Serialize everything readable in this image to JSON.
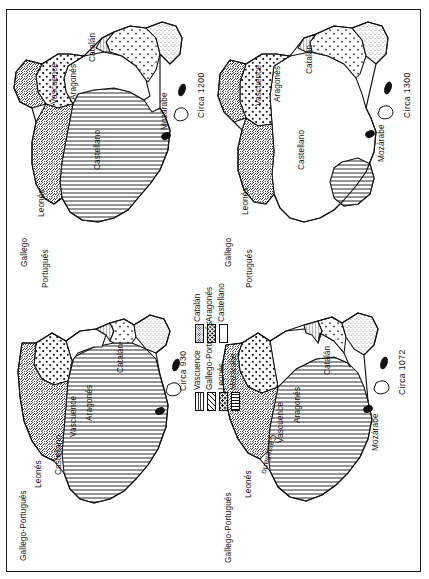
{
  "figure": {
    "orientation": "page rotated 90 degrees (landscape figure on portrait page)",
    "panel_count": 4
  },
  "patterns": {
    "vascuence": {
      "name": "Vascuence",
      "fill": "fine-vertical-hatch"
    },
    "gallego_portugues": {
      "name": "Gallego-Portugués",
      "fill": "diagonal-hatch"
    },
    "leones": {
      "name": "Leonés",
      "fill": "coarse-dots"
    },
    "mozarabe": {
      "name": "Mozárabe",
      "fill": "horizontal-lines"
    },
    "catalan": {
      "name": "Catalán",
      "fill": "stipple-fine-dots"
    },
    "aragones": {
      "name": "Aragonés",
      "fill": "medium-dots"
    },
    "castellano": {
      "name": "Castellano",
      "fill": "blank-white"
    }
  },
  "legend": {
    "name": "map-legend",
    "column_left": [
      {
        "label": "Vascuence",
        "pattern": "fine-vertical-hatch"
      },
      {
        "label": "Gallego-Portugués",
        "pattern": "diagonal-hatch"
      },
      {
        "label": "Leonés",
        "pattern": "coarse-dots"
      },
      {
        "label": "Mozárabe",
        "pattern": "horizontal-lines"
      }
    ],
    "column_right": [
      {
        "label": "Catalán",
        "pattern": "stipple-fine-dots"
      },
      {
        "label": "Aragonés",
        "pattern": "medium-dots"
      },
      {
        "label": "Castellano",
        "pattern": "blank-white"
      }
    ]
  },
  "maps": [
    {
      "id": "map-circa-930",
      "date_label": "Circa  930",
      "position": "bottom-left",
      "region_labels": [
        "Gallego-Portugués",
        "Leonés",
        "Castellano",
        "Vascuence",
        "Aragonés",
        "Catalán"
      ],
      "unlabeled_large_region": "Mozárabe"
    },
    {
      "id": "map-circa-1072",
      "date_label": "Circa  1072",
      "position": "bottom-right",
      "region_labels": [
        "Gallego-Portugués",
        "Leonés",
        "Castellano",
        "Vascuence",
        "Aragonés",
        "Catalán",
        "Mozárabe"
      ]
    },
    {
      "id": "map-circa-1200",
      "date_label": "Circa  1200",
      "position": "top-left",
      "region_labels": [
        "Gallego",
        "Portugués",
        "Leonés",
        "Castellano",
        "Vascuence",
        "Aragonés",
        "Catalán",
        "Mozárabe"
      ]
    },
    {
      "id": "map-circa-1300",
      "date_label": "Circa  1300",
      "position": "top-right",
      "region_labels": [
        "Gallego",
        "Portugués",
        "Leonés",
        "Castellano",
        "Vascuence",
        "Aragonés",
        "Catalán",
        "Mozárabe"
      ]
    }
  ]
}
